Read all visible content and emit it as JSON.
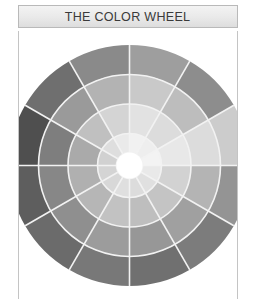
{
  "title": {
    "text": "THE COLOR WHEEL"
  },
  "frame": {
    "border_color": "#c4c4c4",
    "background": "#ffffff"
  },
  "chart_data": {
    "type": "pie",
    "title": "THE COLOR WHEEL",
    "subtitle": "",
    "xlabel": "",
    "ylabel": "",
    "legend_position": "none",
    "grid": false,
    "sector_count": 12,
    "ring_count": 4,
    "sector_angle_deg": 30,
    "start_angle_deg": -90,
    "center": {
      "x": 120.5,
      "y": 120.5
    },
    "outer_radius": 120.5,
    "ring_radii": [
      120.5,
      91,
      61.5,
      32,
      13
    ],
    "separator_color": "#f2f2f2",
    "hub_color": "#ffffff",
    "sectors": [
      {
        "index": 0,
        "name": "yellow",
        "angle_deg": -90,
        "values": [
          "#9e9e9e",
          "#c9c9c9",
          "#e2e2e2",
          "#f1f1f1"
        ]
      },
      {
        "index": 1,
        "name": "yellow-orange",
        "angle_deg": -60,
        "values": [
          "#8d8d8d",
          "#bdbdbd",
          "#dcdcdc",
          "#eeeeee"
        ]
      },
      {
        "index": 2,
        "name": "orange",
        "angle_deg": -30,
        "values": [
          "#cccccc",
          "#dcdcdc",
          "#e8e8e8",
          "#f3f3f3"
        ]
      },
      {
        "index": 3,
        "name": "red-orange",
        "angle_deg": 0,
        "values": [
          "#949494",
          "#b4b4b4",
          "#d2d2d2",
          "#e9e9e9"
        ]
      },
      {
        "index": 4,
        "name": "red",
        "angle_deg": 30,
        "values": [
          "#7c7c7c",
          "#a0a0a0",
          "#c4c4c4",
          "#e0e0e0"
        ]
      },
      {
        "index": 5,
        "name": "red-violet",
        "angle_deg": 60,
        "values": [
          "#707070",
          "#979797",
          "#bebebe",
          "#dcdcdc"
        ]
      },
      {
        "index": 6,
        "name": "violet",
        "angle_deg": 90,
        "values": [
          "#787878",
          "#9c9c9c",
          "#c2c2c2",
          "#dfdfdf"
        ]
      },
      {
        "index": 7,
        "name": "blue-violet",
        "angle_deg": 120,
        "values": [
          "#6b6b6b",
          "#8f8f8f",
          "#b6b6b6",
          "#d8d8d8"
        ]
      },
      {
        "index": 8,
        "name": "blue",
        "angle_deg": 150,
        "values": [
          "#5e5e5e",
          "#878787",
          "#b0b0b0",
          "#d4d4d4"
        ]
      },
      {
        "index": 9,
        "name": "blue-green",
        "angle_deg": 180,
        "values": [
          "#4f4f4f",
          "#7e7e7e",
          "#aaaaaa",
          "#d1d1d1"
        ]
      },
      {
        "index": 10,
        "name": "green",
        "angle_deg": 210,
        "values": [
          "#6f6f6f",
          "#9a9a9a",
          "#c0c0c0",
          "#dedede"
        ]
      },
      {
        "index": 11,
        "name": "yellow-green",
        "angle_deg": 240,
        "values": [
          "#8a8a8a",
          "#b3b3b3",
          "#d4d4d4",
          "#eaeaea"
        ]
      }
    ]
  }
}
